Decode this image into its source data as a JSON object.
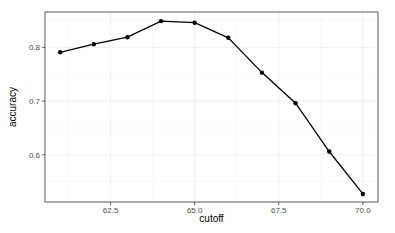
{
  "chart_data": {
    "type": "line",
    "title": "",
    "xlabel": "cutoff",
    "ylabel": "accuracy",
    "x": [
      61,
      62,
      63,
      64,
      65,
      66,
      67,
      68,
      69,
      70
    ],
    "series": [
      {
        "name": "accuracy",
        "values": [
          0.791,
          0.806,
          0.819,
          0.849,
          0.846,
          0.818,
          0.753,
          0.696,
          0.606,
          0.527
        ],
        "color": "#000000"
      }
    ],
    "xticks": [
      62.5,
      65.0,
      67.5,
      70.0
    ],
    "xtick_labels": [
      "62.5",
      "65.0",
      "67.5",
      "70.0"
    ],
    "yticks": [
      0.6,
      0.7,
      0.8
    ],
    "ytick_labels": [
      "0.6",
      "0.7",
      "0.8"
    ],
    "xlim": [
      60.55,
      70.45
    ],
    "ylim": [
      0.512,
      0.866
    ],
    "grid": true,
    "legend": "none",
    "theme": "ggplot2 theme_bw"
  }
}
